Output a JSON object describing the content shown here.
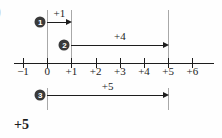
{
  "figure": {
    "corner_label": ")",
    "answer": "+5",
    "background_color": "#fefefe",
    "ink_color": "#1d1d1d",
    "guide_color": "#a8a8a8",
    "badge_color": "#3a3a3a"
  },
  "axis": {
    "ticks": [
      {
        "value": -1,
        "label": "−1"
      },
      {
        "value": 0,
        "label": "0"
      },
      {
        "value": 1,
        "label": "+1"
      },
      {
        "value": 2,
        "label": "+2"
      },
      {
        "value": 3,
        "label": "+3"
      },
      {
        "value": 4,
        "label": "+4"
      },
      {
        "value": 5,
        "label": "+5"
      },
      {
        "value": 6,
        "label": "+6"
      }
    ],
    "min": -1,
    "max": 6
  },
  "guides": [
    {
      "name": "guide-at-0",
      "value": 0,
      "top": 10,
      "bottom": 63
    },
    {
      "name": "guide-at-1",
      "value": 1,
      "top": 10,
      "bottom": 63
    },
    {
      "name": "guide-at-5",
      "value": 5,
      "top": 10,
      "bottom": 63
    },
    {
      "name": "guide-at-0-lower",
      "value": 0,
      "top": 88,
      "bottom": 110
    },
    {
      "name": "guide-at-5-lower",
      "value": 5,
      "top": 88,
      "bottom": 110
    }
  ],
  "jumps": [
    {
      "step": "1",
      "badge_text": "1",
      "label": "+1",
      "from": 0,
      "to": 1,
      "row_y": 22,
      "label_y": 8
    },
    {
      "step": "2",
      "badge_text": "2",
      "label": "+4",
      "from": 1,
      "to": 5,
      "row_y": 45,
      "label_y": 31
    },
    {
      "step": "3",
      "badge_text": "3",
      "label": "+5",
      "from": 0,
      "to": 5,
      "row_y": 95,
      "label_y": 81
    }
  ],
  "chart_data": {
    "type": "line",
    "title": "",
    "xlabel": "",
    "ylabel": "",
    "xlim": [
      -1,
      6
    ],
    "grid": false,
    "legend": "none",
    "categories": [
      "−1",
      "0",
      "+1",
      "+2",
      "+3",
      "+4",
      "+5",
      "+6"
    ],
    "series": [
      {
        "name": "step 1",
        "label": "+1",
        "start": 0,
        "end": 1,
        "length": 1
      },
      {
        "name": "step 2",
        "label": "+4",
        "start": 1,
        "end": 5,
        "length": 4
      },
      {
        "name": "step 3",
        "label": "+5",
        "start": 0,
        "end": 5,
        "length": 5
      }
    ],
    "result": "+5",
    "annotations": [
      "+1",
      "+4",
      "+5",
      "+5"
    ]
  }
}
